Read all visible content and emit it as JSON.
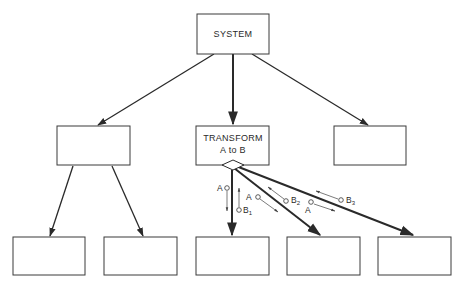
{
  "diagram": {
    "type": "structure-chart",
    "nodes": {
      "root": {
        "label": "SYSTEM"
      },
      "mid_left": {
        "label": ""
      },
      "transform": {
        "line1": "TRANSFORM",
        "line2": "A to B"
      },
      "mid_right": {
        "label": ""
      },
      "leaf_1": {
        "label": ""
      },
      "leaf_2": {
        "label": ""
      },
      "leaf_3": {
        "label": ""
      },
      "leaf_4": {
        "label": ""
      },
      "leaf_5": {
        "label": ""
      }
    },
    "couples": {
      "c1_in": {
        "label": "A"
      },
      "c1_out": {
        "label": "B",
        "sub": "1"
      },
      "c2_in": {
        "label": "A"
      },
      "c2_out": {
        "label": "B",
        "sub": "2"
      },
      "c3_in": {
        "label": "A"
      },
      "c3_out": {
        "label": "B",
        "sub": "3"
      }
    },
    "colors": {
      "line": "#2a2a2a",
      "background": "#ffffff"
    }
  }
}
